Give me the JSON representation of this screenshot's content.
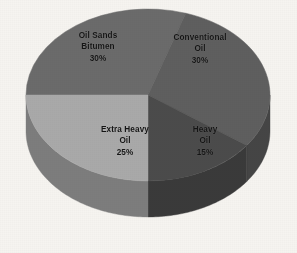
{
  "figure": {
    "background_color": "#f6f4f0",
    "label_text_color": "#141414"
  },
  "chart_data": {
    "type": "pie",
    "title": "",
    "subtitle": "",
    "xlabel": "",
    "ylabel": "",
    "grid": false,
    "legend_position": "none",
    "label_style": "inside-slice",
    "value_unit": "%",
    "three_d": true,
    "categories": [
      "Oil Sands Bitumen",
      "Conventional Oil",
      "Heavy Oil",
      "Extra Heavy Oil"
    ],
    "values": [
      30,
      30,
      15,
      25
    ],
    "slices": [
      {
        "name": "oil-sands-bitumen",
        "label_lines": [
          "Oil Sands",
          "Bitumen",
          "30%"
        ],
        "category": "Oil Sands Bitumen",
        "value": 30,
        "value_text": "30%",
        "top_color": "#6b6b6b",
        "side_color": "#4e4e4e",
        "start_angle_deg": 180,
        "end_angle_deg": 288
      },
      {
        "name": "conventional-oil",
        "label_lines": [
          "Conventional",
          "Oil",
          "30%"
        ],
        "category": "Conventional Oil",
        "value": 30,
        "value_text": "30%",
        "top_color": "#5f5f5f",
        "side_color": "#454545",
        "start_angle_deg": 288,
        "end_angle_deg": 36
      },
      {
        "name": "heavy-oil",
        "label_lines": [
          "Heavy",
          "Oil",
          "15%"
        ],
        "category": "Heavy Oil",
        "value": 15,
        "value_text": "15%",
        "top_color": "#4b4b4b",
        "side_color": "#3a3a3a",
        "start_angle_deg": 36,
        "end_angle_deg": 90
      },
      {
        "name": "extra-heavy-oil",
        "label_lines": [
          "Extra Heavy",
          "Oil",
          "25%"
        ],
        "category": "Extra Heavy Oil",
        "value": 25,
        "value_text": "25%",
        "top_color": "#a9a9a9",
        "side_color": "#7d7d7d",
        "start_angle_deg": 90,
        "end_angle_deg": 180
      }
    ],
    "geometry": {
      "center_x": 148,
      "center_y": 95,
      "radius_x": 122,
      "radius_y": 86,
      "depth": 36
    }
  }
}
